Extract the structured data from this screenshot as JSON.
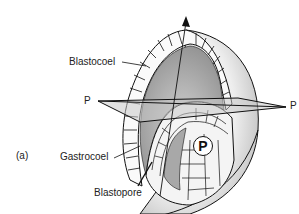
{
  "figure": {
    "panel_label": "(a)",
    "labels": {
      "blastocoel": "Blastocoel",
      "gastrocoel": "Gastrocoel",
      "blastopore": "Blastopore",
      "plane_left": "P",
      "plane_right": "P",
      "pole_marker": "P"
    },
    "colors": {
      "line": "#111111",
      "stipple_dark": "#9a9a9a",
      "stipple_light": "#d8d8d8",
      "plane_fill": "#c8c8c8"
    }
  }
}
